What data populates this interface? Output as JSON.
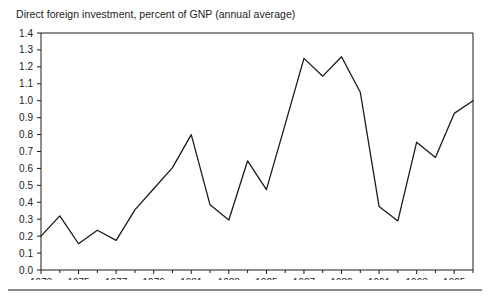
{
  "figure": {
    "title": "Direct foreign investment, percent of GNP (annual average)",
    "bottom_rule_name": "footer-rule"
  },
  "chart_data": {
    "type": "line",
    "title": "Direct foreign investment, percent of GNP (annual average)",
    "xlabel": "",
    "ylabel": "",
    "ylim": [
      0.0,
      1.4
    ],
    "xlim": [
      1973,
      1996
    ],
    "grid": false,
    "legend": null,
    "line_color": "#1a1a1a",
    "x": [
      1973,
      1974,
      1975,
      1976,
      1977,
      1978,
      1979,
      1980,
      1981,
      1982,
      1983,
      1984,
      1985,
      1986,
      1987,
      1988,
      1989,
      1990,
      1991,
      1992,
      1993,
      1994,
      1995,
      1996
    ],
    "values": [
      0.2,
      0.32,
      0.155,
      0.235,
      0.175,
      0.355,
      0.48,
      0.605,
      0.8,
      0.385,
      0.295,
      0.645,
      0.475,
      0.86,
      1.25,
      1.145,
      1.26,
      1.05,
      0.375,
      0.29,
      0.755,
      0.665,
      0.925,
      1.0
    ],
    "y_ticks": [
      "0.0",
      "0.1",
      "0.2",
      "0.3",
      "0.4",
      "0.5",
      "0.6",
      "0.7",
      "0.8",
      "0.9",
      "1.0",
      "1.1",
      "1.2",
      "1.3",
      "1.4"
    ],
    "y_tick_values": [
      0.0,
      0.1,
      0.2,
      0.3,
      0.4,
      0.5,
      0.6,
      0.7,
      0.8,
      0.9,
      1.0,
      1.1,
      1.2,
      1.3,
      1.4
    ],
    "x_ticks": [
      "1973",
      "1975",
      "1977",
      "1979",
      "1981",
      "1983",
      "1985",
      "1987",
      "1989",
      "1991",
      "1993",
      "1995"
    ],
    "x_tick_values": [
      1973,
      1975,
      1977,
      1979,
      1981,
      1983,
      1985,
      1987,
      1989,
      1991,
      1993,
      1995
    ],
    "x_minor_values": [
      1974,
      1976,
      1978,
      1980,
      1982,
      1984,
      1986,
      1988,
      1990,
      1992,
      1994,
      1996
    ]
  }
}
